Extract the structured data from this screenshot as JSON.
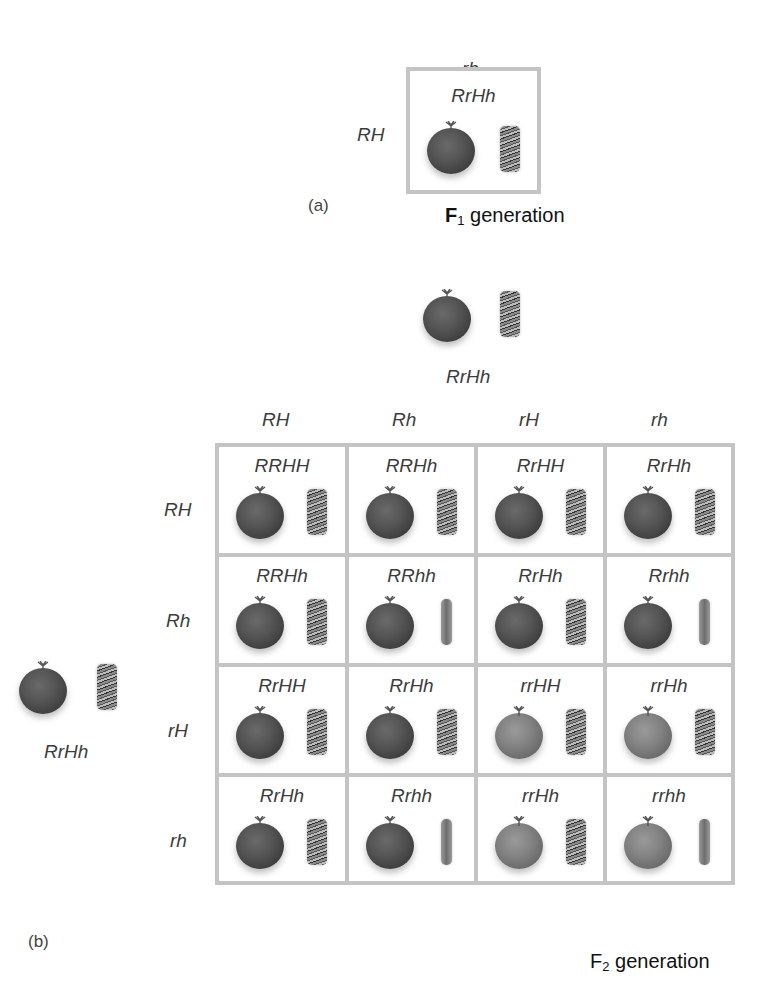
{
  "panel_a": {
    "letter": "(a)",
    "column_gamete": "rh",
    "row_gamete": "RH",
    "cell": {
      "genotype": "RrHh",
      "fruit": "red",
      "stem": "hairy"
    },
    "generation_label": {
      "prefix": "F",
      "subscript": "1",
      "suffix": " generation"
    }
  },
  "panel_b": {
    "letter": "(b)",
    "top_parent": {
      "genotype": "RrHh",
      "fruit": "red",
      "stem": "hairy"
    },
    "left_parent": {
      "genotype": "RrHh",
      "fruit": "red",
      "stem": "hairy"
    },
    "column_gametes": [
      "RH",
      "Rh",
      "rH",
      "rh"
    ],
    "row_gametes": [
      "RH",
      "Rh",
      "rH",
      "rh"
    ],
    "grid": [
      [
        {
          "genotype": "RRHH",
          "fruit": "red",
          "stem": "hairy"
        },
        {
          "genotype": "RRHh",
          "fruit": "red",
          "stem": "hairy"
        },
        {
          "genotype": "RrHH",
          "fruit": "red",
          "stem": "hairy"
        },
        {
          "genotype": "RrHh",
          "fruit": "red",
          "stem": "hairy"
        }
      ],
      [
        {
          "genotype": "RRHh",
          "fruit": "red",
          "stem": "hairy"
        },
        {
          "genotype": "RRhh",
          "fruit": "red",
          "stem": "smooth"
        },
        {
          "genotype": "RrHh",
          "fruit": "red",
          "stem": "hairy"
        },
        {
          "genotype": "Rrhh",
          "fruit": "red",
          "stem": "smooth"
        }
      ],
      [
        {
          "genotype": "RrHH",
          "fruit": "red",
          "stem": "hairy"
        },
        {
          "genotype": "RrHh",
          "fruit": "red",
          "stem": "hairy"
        },
        {
          "genotype": "rrHH",
          "fruit": "yellow",
          "stem": "hairy"
        },
        {
          "genotype": "rrHh",
          "fruit": "yellow",
          "stem": "hairy"
        }
      ],
      [
        {
          "genotype": "RrHh",
          "fruit": "red",
          "stem": "hairy"
        },
        {
          "genotype": "Rrhh",
          "fruit": "red",
          "stem": "smooth"
        },
        {
          "genotype": "rrHh",
          "fruit": "yellow",
          "stem": "hairy"
        },
        {
          "genotype": "rrhh",
          "fruit": "yellow",
          "stem": "smooth"
        }
      ]
    ],
    "generation_label": {
      "prefix": "F",
      "subscript": "2",
      "suffix": " generation"
    }
  },
  "colors": {
    "border": "#c4c4c4",
    "text": "#3c3c3c",
    "label": "#111111"
  }
}
